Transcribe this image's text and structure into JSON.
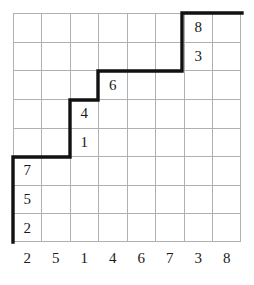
{
  "figure": {
    "grid": {
      "columns": 8,
      "rows": 8,
      "line_color": "#b0b0b0",
      "path_color": "#111111",
      "background": "#ffffff"
    }
  },
  "column_labels": [
    "2",
    "5",
    "1",
    "4",
    "6",
    "7",
    "3",
    "8"
  ],
  "cells": [
    {
      "name": "cell-c7-r1",
      "col": 7,
      "row": 1,
      "value": "8"
    },
    {
      "name": "cell-c7-r2",
      "col": 7,
      "row": 2,
      "value": "3"
    },
    {
      "name": "cell-c4-r3",
      "col": 4,
      "row": 3,
      "value": "6"
    },
    {
      "name": "cell-c3-r4",
      "col": 3,
      "row": 4,
      "value": "4"
    },
    {
      "name": "cell-c3-r5",
      "col": 3,
      "row": 5,
      "value": "1"
    },
    {
      "name": "cell-c1-r6",
      "col": 1,
      "row": 6,
      "value": "7"
    },
    {
      "name": "cell-c1-r7",
      "col": 1,
      "row": 7,
      "value": "5"
    },
    {
      "name": "cell-c1-r8",
      "col": 1,
      "row": 8,
      "value": "2"
    }
  ],
  "staircase_path": {
    "description": "thick stepped boundary from lower-left to upper-right",
    "points": "0,229 0,144 57,144 57,87 85,87 85,58 169,58 169,0 229,0"
  },
  "chart_data": {
    "type": "table",
    "title": "",
    "xlabel": "",
    "ylabel": "",
    "categories": [
      "2",
      "5",
      "1",
      "4",
      "6",
      "7",
      "3",
      "8"
    ],
    "grid": true,
    "columns": 8,
    "rows": 8,
    "entries": [
      {
        "col": 1,
        "row": 6,
        "value": 7
      },
      {
        "col": 1,
        "row": 7,
        "value": 5
      },
      {
        "col": 1,
        "row": 8,
        "value": 2
      },
      {
        "col": 3,
        "row": 4,
        "value": 4
      },
      {
        "col": 3,
        "row": 5,
        "value": 1
      },
      {
        "col": 4,
        "row": 3,
        "value": 6
      },
      {
        "col": 7,
        "row": 1,
        "value": 8
      },
      {
        "col": 7,
        "row": 2,
        "value": 3
      }
    ],
    "path_vertices": [
      [
        0,
        8
      ],
      [
        0,
        5
      ],
      [
        2,
        5
      ],
      [
        2,
        3
      ],
      [
        3,
        3
      ],
      [
        3,
        2
      ],
      [
        6,
        2
      ],
      [
        6,
        0
      ],
      [
        8,
        0
      ]
    ]
  }
}
